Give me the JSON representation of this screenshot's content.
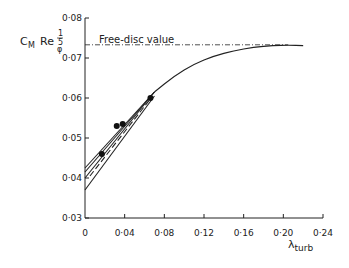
{
  "chart_data": {
    "type": "line",
    "title": "",
    "xlabel": "λ_turb",
    "ylabel": "C_M Re_φ^(1/5)",
    "xlim": [
      0,
      0.24
    ],
    "ylim": [
      0.03,
      0.08
    ],
    "x_ticks": [
      "0",
      "0·04",
      "0·08",
      "0·12",
      "0·16",
      "0·20",
      "0·24"
    ],
    "y_ticks": [
      "0·03",
      "0·04",
      "0·05",
      "0·06",
      "0·07",
      "0·08"
    ],
    "grid": false,
    "annotations": [
      {
        "text": "Free-disc value",
        "y": 0.0733
      }
    ],
    "reference_line": {
      "name": "Free-disc value",
      "y": 0.0733,
      "style": "dash-dot"
    },
    "series": [
      {
        "name": "Main curve",
        "style": "solid",
        "x": [
          0.07,
          0.09,
          0.11,
          0.13,
          0.15,
          0.17,
          0.19,
          0.205,
          0.22
        ],
        "y": [
          0.0615,
          0.0655,
          0.0685,
          0.0705,
          0.0718,
          0.0727,
          0.0731,
          0.0732,
          0.0731
        ]
      },
      {
        "name": "Line A",
        "style": "solid",
        "x": [
          0,
          0.07
        ],
        "y": [
          0.0425,
          0.0615
        ]
      },
      {
        "name": "Line B",
        "style": "solid",
        "x": [
          0,
          0.07
        ],
        "y": [
          0.0415,
          0.0615
        ]
      },
      {
        "name": "Line C",
        "style": "solid",
        "x": [
          0,
          0.07
        ],
        "y": [
          0.04,
          0.0615
        ]
      },
      {
        "name": "Line D",
        "style": "dashed",
        "x": [
          0.005,
          0.065
        ],
        "y": [
          0.0405,
          0.0595
        ]
      },
      {
        "name": "Line E",
        "style": "solid",
        "x": [
          0,
          0.07
        ],
        "y": [
          0.037,
          0.0605
        ]
      }
    ],
    "points": {
      "name": "Measured",
      "x": [
        0.017,
        0.032,
        0.038,
        0.066
      ],
      "y": [
        0.046,
        0.053,
        0.0535,
        0.06
      ]
    }
  },
  "labels": {
    "ylabel_main": "C",
    "ylabel_sub": "M",
    "ylabel_re": "Re",
    "ylabel_phi": "φ",
    "ylabel_exp_num": "1",
    "ylabel_exp_den": "5",
    "xlabel_main": "λ",
    "xlabel_sub": "turb",
    "free_disc": "Free-disc value"
  }
}
